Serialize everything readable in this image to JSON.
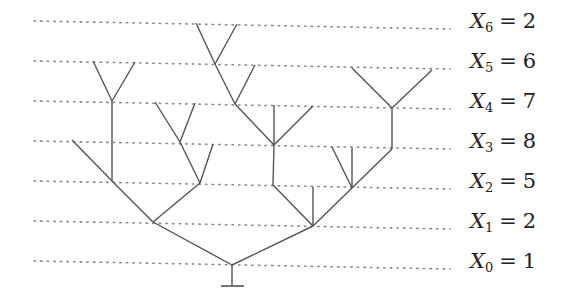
{
  "diagram": {
    "type": "branching-process-tree",
    "line_color": "#555555",
    "dot_color": "#888888",
    "generations": [
      {
        "index": 0,
        "var": "X",
        "sub": "0",
        "eq": "=",
        "value": "1",
        "y": 264
      },
      {
        "index": 1,
        "var": "X",
        "sub": "1",
        "eq": "=",
        "value": "2",
        "y": 224
      },
      {
        "index": 2,
        "var": "X",
        "sub": "2",
        "eq": "=",
        "value": "5",
        "y": 184
      },
      {
        "index": 3,
        "var": "X",
        "sub": "3",
        "eq": "=",
        "value": "8",
        "y": 144
      },
      {
        "index": 4,
        "var": "X",
        "sub": "4",
        "eq": "=",
        "value": "7",
        "y": 104
      },
      {
        "index": 5,
        "var": "X",
        "sub": "5",
        "eq": "=",
        "value": "6",
        "y": 64
      },
      {
        "index": 6,
        "var": "X",
        "sub": "6",
        "eq": "=",
        "value": "2",
        "y": 24
      }
    ],
    "root_stem": {
      "x": 232,
      "y1": 265,
      "y2": 286,
      "bar_x1": 221,
      "bar_x2": 244
    },
    "edges": [
      [
        232,
        265,
        153,
        222
      ],
      [
        232,
        265,
        313,
        226
      ],
      [
        153,
        222,
        112,
        181
      ],
      [
        153,
        222,
        200,
        183
      ],
      [
        313,
        226,
        273,
        185
      ],
      [
        313,
        226,
        313,
        187
      ],
      [
        313,
        226,
        352,
        188
      ],
      [
        112,
        181,
        72,
        140
      ],
      [
        112,
        181,
        112,
        141
      ],
      [
        200,
        183,
        180,
        142
      ],
      [
        200,
        183,
        213,
        144
      ],
      [
        273,
        185,
        274,
        145
      ],
      [
        352,
        188,
        332,
        147
      ],
      [
        352,
        188,
        352,
        148
      ],
      [
        352,
        188,
        392,
        149
      ],
      [
        112,
        141,
        112,
        101
      ],
      [
        180,
        142,
        155,
        102
      ],
      [
        180,
        142,
        195,
        103
      ],
      [
        274,
        145,
        235,
        104
      ],
      [
        274,
        145,
        274,
        105
      ],
      [
        274,
        145,
        313,
        106
      ],
      [
        392,
        149,
        392,
        108
      ],
      [
        112,
        101,
        93,
        61
      ],
      [
        112,
        101,
        135,
        62
      ],
      [
        235,
        104,
        215,
        64
      ],
      [
        235,
        104,
        255,
        65
      ],
      [
        392,
        108,
        352,
        68
      ],
      [
        392,
        108,
        432,
        70
      ],
      [
        215,
        64,
        196,
        23
      ],
      [
        215,
        64,
        237,
        24
      ]
    ]
  }
}
